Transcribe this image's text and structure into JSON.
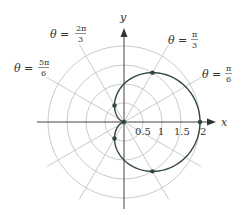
{
  "chart_data": {
    "type": "line",
    "subtype": "polar",
    "title": "",
    "equation": "r = 1 + cos(theta)",
    "curve_name": "cardioid",
    "xlabel": "x",
    "ylabel": "y",
    "radial_ticks": [
      0.5,
      1,
      1.5,
      2
    ],
    "radial_tick_labels": [
      "0.5",
      "1",
      "1.5",
      "2"
    ],
    "angular_gridlines_deg": [
      0,
      30,
      60,
      90,
      120,
      150,
      180,
      210,
      240,
      270,
      300,
      330
    ],
    "rlim": [
      0,
      2
    ],
    "grid": true,
    "angle_annotations": [
      {
        "label_lhs": "θ =",
        "num": "π",
        "den": "6",
        "angle_deg": 30
      },
      {
        "label_lhs": "θ =",
        "num": "π",
        "den": "3",
        "angle_deg": 60
      },
      {
        "label_lhs": "θ =",
        "num": "2π",
        "den": "3",
        "angle_deg": 120
      },
      {
        "label_lhs": "θ =",
        "num": "5π",
        "den": "6",
        "angle_deg": 150
      }
    ],
    "marked_points": [
      {
        "theta": "0",
        "r": 2
      },
      {
        "theta": "π/3",
        "r": 1.5
      },
      {
        "theta": "2π/3",
        "r": 0.5
      },
      {
        "theta": "π",
        "r": 0
      },
      {
        "theta": "4π/3",
        "r": 0.5
      },
      {
        "theta": "5π/3",
        "r": 1.5
      }
    ],
    "colors": {
      "curve": "#2f463f",
      "grid": "#c4c4c4",
      "axis": "#444444"
    }
  },
  "labels": {
    "x_axis": "x",
    "y_axis": "y",
    "ticks": [
      "0.5",
      "1",
      "1.5",
      "2"
    ],
    "theta_pi6": {
      "lhs": "θ =",
      "num": "π",
      "den": "6"
    },
    "theta_pi3": {
      "lhs": "θ =",
      "num": "π",
      "den": "3"
    },
    "theta_2pi3": {
      "lhs": "θ =",
      "num": "2π",
      "den": "3"
    },
    "theta_5pi6": {
      "lhs": "θ =",
      "num": "5π",
      "den": "6"
    }
  }
}
